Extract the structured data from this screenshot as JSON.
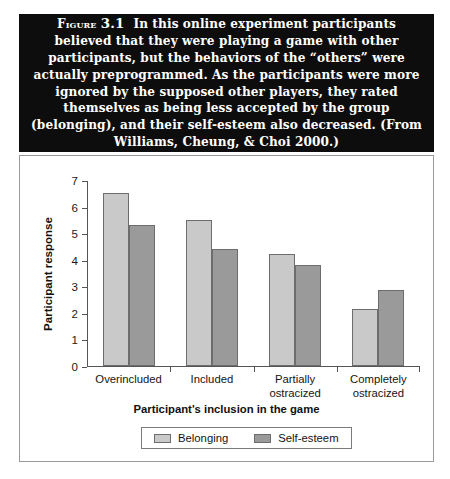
{
  "caption": {
    "figure_label": "Figure",
    "figure_number": "3.1",
    "text": "In this online experiment participants believed that they were playing a game with other participants, but the behaviors of the “others” were actually preprogrammed. As the participants were more ignored by the supposed other players, they rated themselves as being less accepted by the group (belonging), and their self-esteem also decreased. (From Williams, Cheung, & Choi 2000.)"
  },
  "colors": {
    "belonging": "#c9c9c9",
    "self_esteem": "#9a9a9a",
    "caption_background": "#0d0d0d",
    "caption_text": "#ffffff",
    "panel_border": "#9a9a9a",
    "axis": "#555555"
  },
  "chart_data": {
    "type": "bar",
    "title": "",
    "xlabel": "Participant's inclusion in the game",
    "ylabel": "Participant response",
    "categories": [
      "Overincluded",
      "Included",
      "Partially\nostracized",
      "Completely\nostracized"
    ],
    "series": [
      {
        "name": "Belonging",
        "values": [
          6.5,
          5.5,
          4.2,
          2.15
        ]
      },
      {
        "name": "Self-esteem",
        "values": [
          5.3,
          4.4,
          3.8,
          2.85
        ]
      }
    ],
    "ylim": [
      0,
      7
    ],
    "yticks": [
      0,
      1,
      2,
      3,
      4,
      5,
      6,
      7
    ],
    "grid": false,
    "legend_position": "bottom"
  }
}
